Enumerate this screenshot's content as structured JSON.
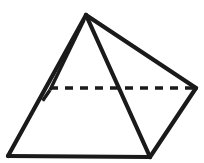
{
  "figure": {
    "shape_type": "square-pyramid",
    "canvas": {
      "width": 204,
      "height": 163
    },
    "colors": {
      "background": "#ffffff",
      "stroke": "#1a1a1a",
      "face": "#ffffff"
    },
    "stroke": {
      "solid_width": 4.2,
      "hidden_width": 3.4,
      "dash_pattern": "8 7"
    },
    "vertices": {
      "apex": {
        "label": "apex",
        "x": 86,
        "y": 15
      },
      "base_front_left": {
        "label": "base-front-left",
        "x": 8,
        "y": 156
      },
      "base_front_right": {
        "label": "base-front-right",
        "x": 150,
        "y": 157
      },
      "base_back_right": {
        "label": "base-back-right",
        "x": 196,
        "y": 88
      },
      "base_back_left": {
        "label": "base-back-left",
        "x": 50,
        "y": 88
      }
    },
    "edges": [
      {
        "name": "apex-to-front-left",
        "from": "apex",
        "to": "base_front_left",
        "style": "solid",
        "visible": true
      },
      {
        "name": "apex-to-front-right",
        "from": "apex",
        "to": "base_front_right",
        "style": "solid",
        "visible": true
      },
      {
        "name": "apex-to-back-right",
        "from": "apex",
        "to": "base_back_right",
        "style": "solid",
        "visible": true
      },
      {
        "name": "apex-to-back-left",
        "from": "apex",
        "to": "base_back_left",
        "style": "solid-hidden",
        "visible": true
      },
      {
        "name": "base-front-left-to-front-right",
        "from": "base_front_left",
        "to": "base_front_right",
        "style": "solid",
        "visible": true
      },
      {
        "name": "base-front-right-to-back-right",
        "from": "base_front_right",
        "to": "base_back_right",
        "style": "solid",
        "visible": true
      },
      {
        "name": "base-back-left-to-back-right",
        "from": "base_back_left",
        "to": "base_back_right",
        "style": "dashed",
        "visible": false
      },
      {
        "name": "base-back-left-to-front-left",
        "from": "base_back_left",
        "to": "base_front_left",
        "style": "dashed-partial",
        "visible": false
      }
    ],
    "faces": [
      {
        "name": "front-left-face",
        "vertices": [
          "apex",
          "base_front_left",
          "base_front_right"
        ]
      },
      {
        "name": "front-right-face",
        "vertices": [
          "apex",
          "base_front_right",
          "base_back_right"
        ]
      }
    ]
  }
}
